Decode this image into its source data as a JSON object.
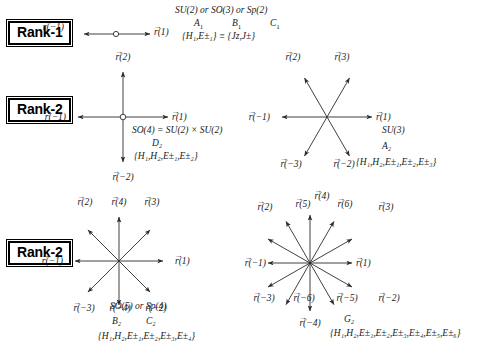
{
  "figure": {
    "vector_symbol": "r",
    "arrow_accent": "→"
  },
  "rank_labels": {
    "rank1": "Rank-1",
    "rank2_a": "Rank-2",
    "rank2_b": "Rank-2"
  },
  "panels": [
    {
      "id": "A1",
      "rank": 1,
      "groups": "SU(2) or SO(3) or Sp(2)",
      "cartan_labels": [
        "A",
        "B",
        "C"
      ],
      "cartan_subscript": "1",
      "generators": "{H₁,E±₁} ≡ {Jᴢ,J±}",
      "root_count": 2,
      "root_labels": [
        "r(1)",
        "r(−1)"
      ],
      "root_angles_deg": [
        0,
        180
      ]
    },
    {
      "id": "D2",
      "rank": 2,
      "groups": "SO(4) = SU(2) × SU(2)",
      "cartan": "D₂",
      "generators": "{H₁,H₂,E±₁,E±₂}",
      "root_count": 4,
      "root_labels": [
        "r(1)",
        "r(2)",
        "r(−1)",
        "r(−2)"
      ],
      "root_angles_deg": [
        0,
        90,
        180,
        270
      ]
    },
    {
      "id": "A2",
      "rank": 2,
      "groups": "SU(3)",
      "cartan": "A₂",
      "generators": "{H₁,H₂,E±₁,E±₂,E±₃}",
      "root_count": 6,
      "root_labels": [
        "r(1)",
        "r(2)",
        "r(3)",
        "r(−1)",
        "r(−2)",
        "r(−3)"
      ],
      "root_angles_deg": [
        0,
        120,
        60,
        180,
        300,
        240
      ]
    },
    {
      "id": "B2C2",
      "rank": 2,
      "groups": "SO(5) or Sp(4)",
      "cartan_labels": [
        "B₂",
        "C₂"
      ],
      "generators": "{H₁,H₂,E±₁,E±₂,E±₃,E±₄}",
      "root_count": 8,
      "root_labels": [
        "r(1)",
        "r(2)",
        "r(3)",
        "r(4)",
        "r(−1)",
        "r(−2)",
        "r(−3)",
        "r(−4)"
      ],
      "root_angles_deg": [
        0,
        135,
        45,
        90,
        180,
        315,
        225,
        270
      ]
    },
    {
      "id": "G2",
      "rank": 2,
      "groups": "",
      "cartan": "G₂",
      "generators": "{H₁,H₂,E±₁,E±₂,E±₃,E±₄,E±₅,E±₆}",
      "root_count": 12,
      "root_labels": [
        "r(1)",
        "r(2)",
        "r(3)",
        "r(4)",
        "r(5)",
        "r(6)",
        "r(−1)",
        "r(−2)",
        "r(−3)",
        "r(−4)",
        "r(−5)",
        "r(−6)"
      ],
      "root_angles_deg": [
        0,
        150,
        30,
        90,
        120,
        60,
        180,
        330,
        210,
        270,
        300,
        240
      ]
    }
  ],
  "a1": {
    "line1": "SU(2) or SO(3) or Sp(2)",
    "l2a": "A",
    "l2a_sub": "1",
    "l2b": "B",
    "l2b_sub": "1",
    "l2c": "C",
    "l2c_sub": "1",
    "line3_open": "{H",
    "gens": "{H₁,E±₁} ≡ {Jᴢ,J±}",
    "r_pos": "r(1)",
    "r_neg": "r(−1)"
  },
  "d2": {
    "line1": "SO(4) = SU(2) × SU(2)",
    "line2": "D₂",
    "line3": "{H₁,H₂,E±₁,E±₂}",
    "labels": {
      "r1": "r(1)",
      "r2": "r(2)",
      "rm1": "r(−1)",
      "rm2": "r(−2)"
    }
  },
  "a2": {
    "line1": "SU(3)",
    "line2": "A₂",
    "line3": "{H₁,H₂,E±₁,E±₂,E±₃}",
    "labels": {
      "r1": "r(1)",
      "r2": "r(2)",
      "r3": "r(3)",
      "rm1": "r(−1)",
      "rm2": "r(−2)",
      "rm3": "r(−3)"
    }
  },
  "b2": {
    "line1": "SO(5) or Sp(4)",
    "line2a": "B₂",
    "line2b": "C₂",
    "line3": "{H₁,H₂,E±₁,E±₂,E±₃,E±₄}",
    "labels": {
      "r1": "r(1)",
      "r2": "r(2)",
      "r3": "r(3)",
      "r4": "r(4)",
      "rm1": "r(−1)",
      "rm2": "r(−2)",
      "rm3": "r(−3)",
      "rm4": "r(−4)"
    }
  },
  "g2": {
    "line2": "G₂",
    "line3": "{H₁,H₂,E±₁,E±₂,E±₃,E±₄,E±₅,E±₆}",
    "labels": {
      "r1": "r(1)",
      "r2": "r(2)",
      "r3": "r(3)",
      "r4": "r(4)",
      "r5": "r(5)",
      "r6": "r(6)",
      "rm1": "r(−1)",
      "rm2": "r(−2)",
      "rm3": "r(−3)",
      "rm4": "r(−4)",
      "rm5": "r(−5)",
      "rm6": "r(−6)"
    }
  }
}
